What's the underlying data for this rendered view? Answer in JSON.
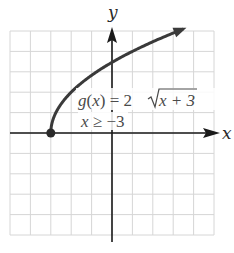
{
  "chart_data": {
    "type": "line",
    "title": "",
    "xlabel": "x",
    "ylabel": "y",
    "xlim": [
      -5,
      5
    ],
    "ylim": [
      -5,
      5
    ],
    "grid": true,
    "grid_step": 1,
    "series": [
      {
        "name": "g(x) = 2√(x+3)",
        "domain": "x ≥ -3",
        "x": [
          -3,
          -2.75,
          -2.5,
          -2,
          -1.5,
          -1,
          0,
          1,
          2,
          3,
          3.6
        ],
        "y": [
          0,
          1.0,
          1.41,
          2.0,
          2.45,
          2.83,
          3.46,
          4.0,
          4.47,
          4.9,
          5.14
        ],
        "start_point": {
          "x": -3,
          "y": 0,
          "style": "closed-dot"
        },
        "end": "arrow"
      }
    ],
    "annotations": [
      {
        "text": "g(x) = 2√(x + 3)",
        "position": {
          "x": 0.2,
          "y": 2
        }
      },
      {
        "text": "x ≥ −3",
        "position": {
          "x": -1.6,
          "y": 1
        }
      }
    ]
  },
  "labels": {
    "x_axis": "x",
    "y_axis": "y",
    "equation_g": "g",
    "equation_paren_open": "(",
    "equation_x": "x",
    "equation_paren_close": ")",
    "equation_eq": " = 2",
    "equation_radicand": "x + 3",
    "domain_x": "x",
    "domain_rest": " ≥ −3"
  },
  "colors": {
    "curve": "#3a3a3a",
    "axes": "#1a1a1a",
    "grid": "#d4d4d4"
  }
}
